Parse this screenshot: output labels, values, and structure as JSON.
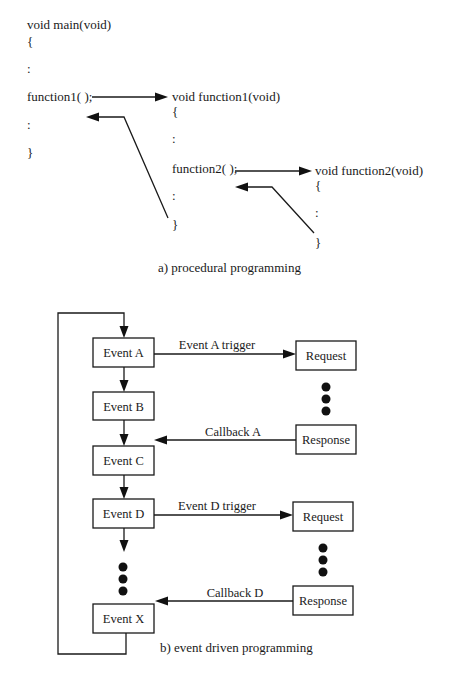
{
  "procedural": {
    "caption": "a) procedural programming",
    "main": {
      "signature": "void main(void)",
      "open_brace": "{",
      "ellipsis1": ":",
      "call": "function1( );",
      "ellipsis2": ":",
      "close_brace": "}"
    },
    "function1": {
      "signature": "void function1(void)",
      "open_brace": "{",
      "ellipsis1": ":",
      "call": "function2( );",
      "ellipsis2": ":",
      "close_brace": "}"
    },
    "function2": {
      "signature": "void function2(void)",
      "open_brace": "{",
      "ellipsis1": ":",
      "close_brace": "}"
    }
  },
  "event_driven": {
    "caption": "b) event driven programming",
    "events": [
      {
        "label": "Event A"
      },
      {
        "label": "Event B"
      },
      {
        "label": "Event C"
      },
      {
        "label": "Event D"
      },
      {
        "label": "Event X"
      }
    ],
    "handlers": [
      {
        "trigger": "Event A trigger",
        "request": "Request",
        "response": "Response",
        "callback": "Callback A"
      },
      {
        "trigger": "Event D trigger",
        "request": "Request",
        "response": "Response",
        "callback": "Callback D"
      }
    ]
  },
  "colors": {
    "ink": "#1a1a1a",
    "background": "#ffffff"
  }
}
